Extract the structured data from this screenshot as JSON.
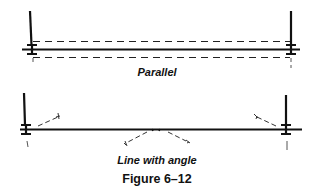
{
  "diagrams": [
    {
      "id": "parallel",
      "label": "Parallel"
    },
    {
      "id": "angle",
      "label": "Line with angle"
    }
  ],
  "figure": {
    "caption": "Figure 6–12"
  },
  "colors": {
    "ink": "#111111",
    "dash": "#222222",
    "background": "#ffffff"
  }
}
